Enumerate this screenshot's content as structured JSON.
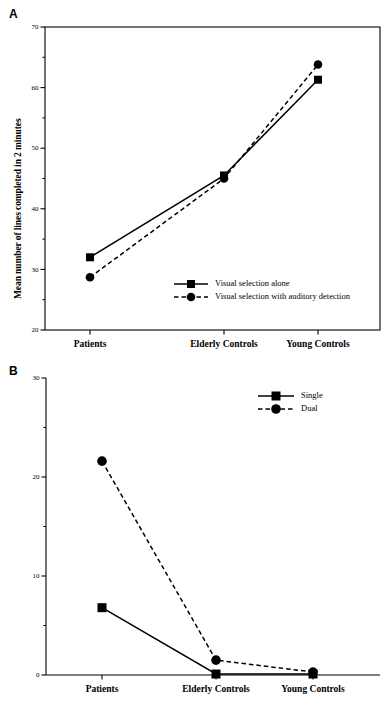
{
  "figure": {
    "panels": [
      {
        "letter": "A",
        "ylabel": "Mean number of lines completed in 2 minutes",
        "categories": [
          "Patients",
          "Elderly Controls",
          "Young Controls"
        ],
        "yticks": [
          "70",
          "60",
          "50",
          "40",
          "30",
          "20"
        ],
        "legend": [
          {
            "label": "Visual selection alone",
            "style": "solid",
            "marker": "square"
          },
          {
            "label": "Visual selection with auditory detection",
            "style": "dashed",
            "marker": "circle"
          }
        ]
      },
      {
        "letter": "B",
        "ylabel": "Auditory detection errors (%)",
        "categories": [
          "Patients",
          "Elderly Controls",
          "Young Controls"
        ],
        "yticks": [
          "30",
          "20",
          "10",
          "0"
        ],
        "legend": [
          {
            "label": "Single",
            "style": "solid",
            "marker": "square"
          },
          {
            "label": "Dual",
            "style": "dashed",
            "marker": "circle"
          }
        ]
      }
    ]
  },
  "chart_data": [
    {
      "type": "line",
      "panel": "A",
      "title": "",
      "xlabel": "",
      "ylabel": "Mean number of lines completed in 2 minutes",
      "categories": [
        "Patients",
        "Elderly Controls",
        "Young Controls"
      ],
      "ylim": [
        20,
        70
      ],
      "ymajor_ticks": [
        20,
        30,
        40,
        50,
        60,
        70
      ],
      "yminor_ticks": [
        25,
        35,
        45,
        55,
        65
      ],
      "grid": false,
      "legend_position": "inside-bottom-center",
      "series": [
        {
          "name": "Visual selection alone",
          "marker": "square",
          "linestyle": "solid",
          "values": [
            32.0,
            45.5,
            61.3
          ]
        },
        {
          "name": "Visual selection with auditory detection",
          "marker": "circle",
          "linestyle": "dashed",
          "values": [
            28.7,
            45.0,
            63.8
          ]
        }
      ]
    },
    {
      "type": "line",
      "panel": "B",
      "title": "",
      "xlabel": "",
      "ylabel": "Auditory detection errors (%)",
      "categories": [
        "Patients",
        "Elderly Controls",
        "Young Controls"
      ],
      "ylim": [
        0,
        30
      ],
      "ymajor_ticks": [
        0,
        10,
        20,
        30
      ],
      "yminor_ticks": [
        5,
        15,
        25
      ],
      "grid": false,
      "legend_position": "inside-top-right",
      "series": [
        {
          "name": "Single",
          "marker": "square",
          "linestyle": "solid",
          "values": [
            6.8,
            0.1,
            0.1
          ]
        },
        {
          "name": "Dual",
          "marker": "circle",
          "linestyle": "dashed",
          "values": [
            21.6,
            1.5,
            0.3
          ]
        }
      ]
    }
  ]
}
